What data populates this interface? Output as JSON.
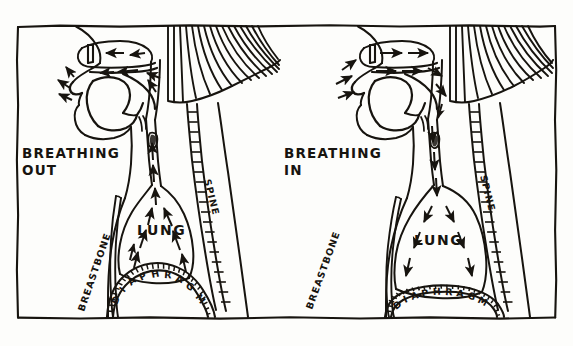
{
  "figure": {
    "title_visible": false,
    "background_color": "#fdfdfb",
    "ink_color": "#17140f",
    "style": "hand-drawn pen and ink line diagram",
    "frame": {
      "name": "hand-drawn rectangular border"
    }
  },
  "panels": [
    {
      "id": "left",
      "caption_line1": "BREATHING",
      "caption_line2": "OUT",
      "state": "exhalation",
      "airflow_direction": "outward / upward",
      "labels": {
        "lung": "LUNG",
        "spine": "SPINE",
        "breastbone": "BREASTBONE",
        "diaphragm": "DIAPHRAGM"
      },
      "diaphragm_shape": "domed upward (relaxed)",
      "arrow_count_airway": 9,
      "arrow_count_lung": 8,
      "arrow_count_head": 8
    },
    {
      "id": "right",
      "caption_line1": "BREATHING",
      "caption_line2": "IN",
      "state": "inhalation",
      "airflow_direction": "inward / downward",
      "labels": {
        "lung": "LUNG",
        "spine": "SPINE",
        "breastbone": "BREASTBONE",
        "diaphragm": "DIAPHRAGM"
      },
      "diaphragm_shape": "flattened (contracted)",
      "arrow_count_airway": 6,
      "arrow_count_lung": 7,
      "arrow_count_head": 9
    }
  ],
  "anatomy_parts": [
    "nasal cavity",
    "mouth",
    "tongue",
    "soft palate",
    "pharynx",
    "trachea",
    "vocal folds",
    "lung",
    "spine",
    "breastbone",
    "diaphragm",
    "neck muscles"
  ]
}
